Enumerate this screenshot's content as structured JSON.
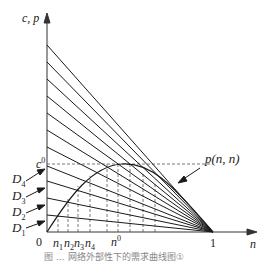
{
  "figure": {
    "y_axis_label": "c, p",
    "x_axis_label": "n",
    "origin_label": "0",
    "x_end_label": "1",
    "curve_label": "p(n, n)",
    "c0_label": "c",
    "c0_sup": "0",
    "n0_label": "n",
    "n0_sup": "0",
    "n_labels": [
      {
        "base": "n",
        "sub": "1"
      },
      {
        "base": "n",
        "sub": "2"
      },
      {
        "base": "n",
        "sub": "3"
      },
      {
        "base": "n",
        "sub": "4"
      }
    ],
    "d_labels": [
      {
        "base": "D",
        "sub": "4"
      },
      {
        "base": "D",
        "sub": "3"
      },
      {
        "base": "D",
        "sub": "2"
      },
      {
        "base": "D",
        "sub": "1"
      }
    ],
    "caption": "图 … 网络外部性下的需求曲线图①"
  },
  "colors": {
    "line": "#1a1a1a",
    "axis": "#333333",
    "dashed": "#555555"
  }
}
